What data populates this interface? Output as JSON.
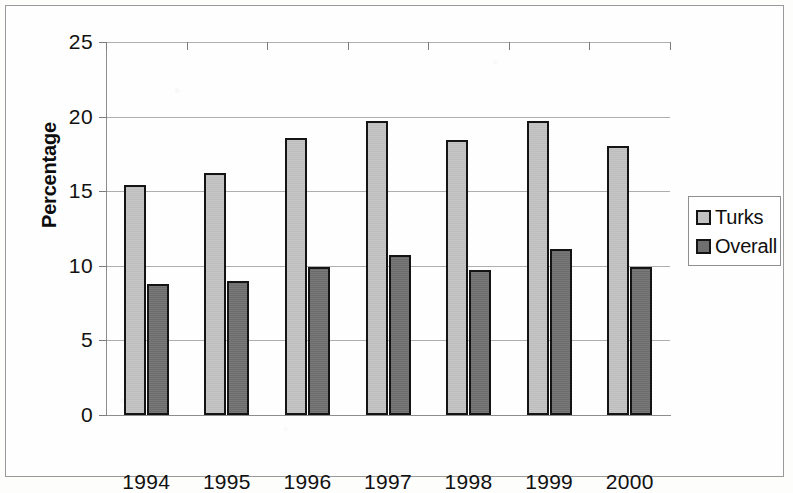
{
  "figure": {
    "y_axis_title": "Percentage",
    "legend": {
      "position": "right",
      "entries": [
        {
          "label": "Turks",
          "color": "#c2c2c2",
          "swatch_name": "legend-swatch-turks"
        },
        {
          "label": "Overall",
          "color": "#6f6f6f",
          "swatch_name": "legend-swatch-overall"
        }
      ]
    }
  },
  "chart_data": {
    "type": "bar",
    "title": "",
    "subtitle": "",
    "xlabel": "",
    "ylabel": "Percentage",
    "categories": [
      "1994",
      "1995",
      "1996",
      "1997",
      "1998",
      "1999",
      "2000"
    ],
    "series": [
      {
        "name": "Turks",
        "color": "#c2c2c2",
        "values": [
          15.4,
          16.2,
          18.6,
          19.7,
          18.4,
          19.7,
          18.0
        ]
      },
      {
        "name": "Overall",
        "color": "#6f6f6f",
        "values": [
          8.8,
          9.0,
          9.9,
          10.7,
          9.7,
          11.1,
          9.9
        ]
      }
    ],
    "ylim": [
      0,
      25
    ],
    "yticks": [
      0,
      5,
      10,
      15,
      20,
      25
    ],
    "ytick_labels": [
      "0",
      "5",
      "10",
      "15",
      "20",
      "25"
    ],
    "grid": true,
    "grid_axis": "y",
    "legend_position": "right",
    "annotations": []
  }
}
